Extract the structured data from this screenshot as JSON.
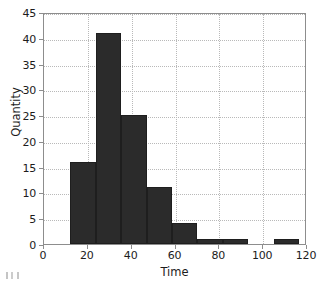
{
  "chart_data": {
    "type": "bar",
    "title": "",
    "xlabel": "Time",
    "ylabel": "Quantity",
    "xlim": [
      0,
      120
    ],
    "ylim": [
      0,
      45
    ],
    "grid": true,
    "legend": null,
    "bar_color": "#2b2b2b",
    "axis_color": "#8d8d8d",
    "grid_color": "#b9b9b9",
    "xticks": [
      0,
      20,
      40,
      60,
      80,
      100,
      120
    ],
    "yticks": [
      0,
      5,
      10,
      15,
      20,
      25,
      30,
      35,
      40,
      45
    ],
    "xtick_labels": [
      "0",
      "20",
      "40",
      "60",
      "80",
      "100",
      "120"
    ],
    "ytick_labels": [
      "0",
      "5",
      "10",
      "15",
      "20",
      "25",
      "30",
      "35",
      "40",
      "45"
    ],
    "bin_width": 11.6,
    "bins": [
      {
        "x0": 12.0,
        "x1": 23.6,
        "value": 16
      },
      {
        "x0": 23.6,
        "x1": 35.2,
        "value": 41
      },
      {
        "x0": 35.2,
        "x1": 46.8,
        "value": 25
      },
      {
        "x0": 46.8,
        "x1": 58.4,
        "value": 11
      },
      {
        "x0": 58.4,
        "x1": 70.0,
        "value": 4
      },
      {
        "x0": 70.0,
        "x1": 81.6,
        "value": 1
      },
      {
        "x0": 81.6,
        "x1": 93.2,
        "value": 1
      },
      {
        "x0": 93.2,
        "x1": 104.8,
        "value": 0
      },
      {
        "x0": 104.8,
        "x1": 116.4,
        "value": 1
      }
    ],
    "categories": [
      "12-23.6",
      "23.6-35.2",
      "35.2-46.8",
      "46.8-58.4",
      "58.4-70",
      "70-81.6",
      "81.6-93.2",
      "93.2-104.8",
      "104.8-116.4"
    ],
    "values": [
      16,
      41,
      25,
      11,
      4,
      1,
      1,
      0,
      1
    ]
  }
}
